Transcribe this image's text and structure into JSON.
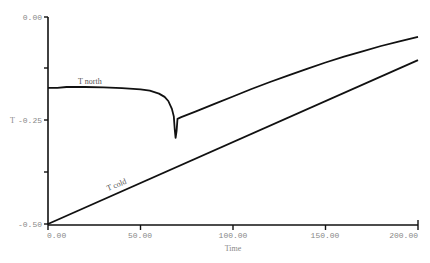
{
  "chart_data": {
    "type": "line",
    "title": "",
    "xlabel": "Time",
    "ylabel": "T",
    "xlim": [
      0,
      200
    ],
    "ylim": [
      -0.5,
      0.0
    ],
    "grid": false,
    "legend": "inline labels",
    "x_ticks": [
      "0.00",
      "50.00",
      "100.00",
      "150.00",
      "200.00"
    ],
    "y_ticks": [
      "0.00",
      "-0.25",
      "-0.50"
    ],
    "series": [
      {
        "name": "T north",
        "x": [
          0,
          5,
          10,
          20,
          30,
          40,
          50,
          55,
          60,
          63,
          65,
          67,
          68,
          68.5,
          69,
          69.5,
          70,
          72,
          80,
          90,
          100,
          110,
          120,
          130,
          140,
          150,
          160,
          170,
          180,
          190,
          200
        ],
        "values": [
          -0.171,
          -0.171,
          -0.169,
          -0.169,
          -0.17,
          -0.172,
          -0.175,
          -0.178,
          -0.185,
          -0.193,
          -0.203,
          -0.222,
          -0.24,
          -0.27,
          -0.292,
          -0.275,
          -0.246,
          -0.242,
          -0.228,
          -0.21,
          -0.192,
          -0.174,
          -0.157,
          -0.141,
          -0.125,
          -0.11,
          -0.096,
          -0.083,
          -0.07,
          -0.059,
          -0.048
        ]
      },
      {
        "name": "T cold",
        "x": [
          0,
          200
        ],
        "values": [
          -0.5,
          -0.104
        ]
      }
    ]
  },
  "labels": {
    "x_axis_title": "Time",
    "y_axis_title": "T",
    "y_ticks": [
      "0.00",
      "-0.25",
      "-0.50"
    ],
    "x_ticks": [
      "0.00",
      "50.00",
      "100.00",
      "150.00",
      "200.00"
    ],
    "series_north": "T north",
    "series_cold": "T cold"
  }
}
